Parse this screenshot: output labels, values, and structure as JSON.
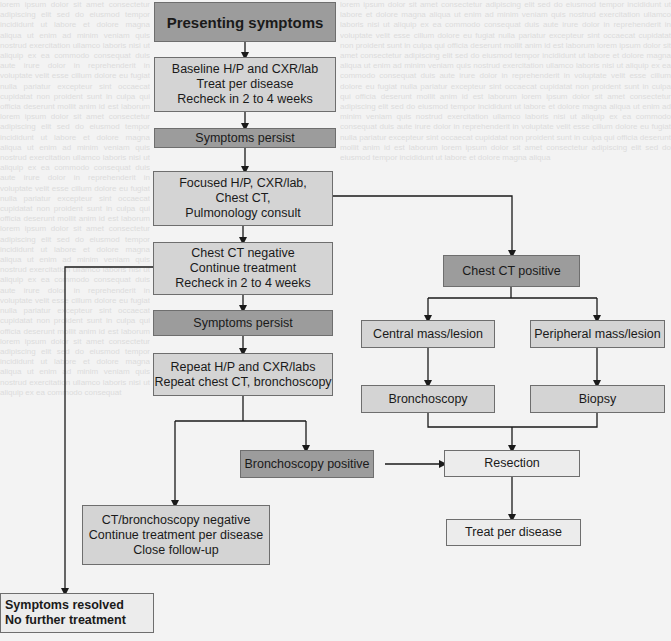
{
  "diagram": {
    "type": "flowchart",
    "nodes": {
      "presenting": {
        "label": "Presenting symptoms",
        "style": "dark"
      },
      "baseline": {
        "label": "Baseline H/P and CXR/lab\nTreat per disease\nRecheck in 2 to 4 weeks",
        "style": "light"
      },
      "persist1": {
        "label": "Symptoms persist",
        "style": "dark"
      },
      "focused": {
        "label": "Focused H/P, CXR/lab,\nChest CT,\nPulmonology consult",
        "style": "light"
      },
      "ct_negative": {
        "label": "Chest CT negative\nContinue treatment\nRecheck in 2 to 4 weeks",
        "style": "light"
      },
      "persist2": {
        "label": "Symptoms persist",
        "style": "dark"
      },
      "repeat": {
        "label": "Repeat H/P and CXR/labs\nRepeat chest CT, bronchoscopy",
        "style": "light"
      },
      "ct_positive": {
        "label": "Chest CT positive",
        "style": "dark"
      },
      "central": {
        "label": "Central mass/lesion",
        "style": "light"
      },
      "peripheral": {
        "label": "Peripheral mass/lesion",
        "style": "light"
      },
      "bronchoscopy": {
        "label": "Bronchoscopy",
        "style": "light"
      },
      "biopsy": {
        "label": "Biopsy",
        "style": "light"
      },
      "bronch_positive": {
        "label": "Bronchoscopy positive",
        "style": "dark"
      },
      "resection": {
        "label": "Resection",
        "style": "pale"
      },
      "ct_bronch_negative": {
        "label": "CT/bronchoscopy negative\nContinue treatment per disease\nClose follow-up",
        "style": "light"
      },
      "treat": {
        "label": "Treat per disease",
        "style": "pale"
      },
      "resolved": {
        "label": "Symptoms resolved\nNo further treatment",
        "style": "pale"
      }
    },
    "edges": [
      [
        "presenting",
        "baseline"
      ],
      [
        "baseline",
        "persist1"
      ],
      [
        "persist1",
        "focused"
      ],
      [
        "focused",
        "ct_negative"
      ],
      [
        "focused",
        "ct_positive"
      ],
      [
        "ct_negative",
        "persist2"
      ],
      [
        "ct_negative",
        "resolved"
      ],
      [
        "persist2",
        "repeat"
      ],
      [
        "repeat",
        "bronch_positive"
      ],
      [
        "repeat",
        "ct_bronch_negative"
      ],
      [
        "ct_positive",
        "central"
      ],
      [
        "ct_positive",
        "peripheral"
      ],
      [
        "central",
        "bronchoscopy"
      ],
      [
        "peripheral",
        "biopsy"
      ],
      [
        "bronchoscopy",
        "resection"
      ],
      [
        "biopsy",
        "resection"
      ],
      [
        "bronch_positive",
        "resection"
      ],
      [
        "resection",
        "treat"
      ]
    ]
  }
}
